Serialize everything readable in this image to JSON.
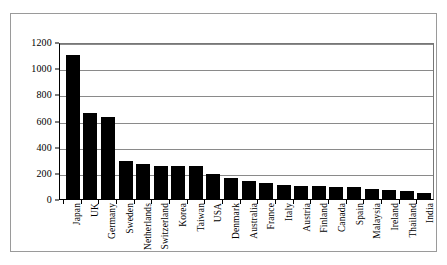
{
  "chart_data": {
    "type": "bar",
    "title": "",
    "subtitle": "",
    "xlabel": "",
    "ylabel": "",
    "ylim": [
      0,
      1200
    ],
    "yticks": [
      0,
      200,
      400,
      600,
      800,
      1000,
      1200
    ],
    "ytick_labels": [
      "0",
      "200",
      "400",
      "600",
      "800",
      "1000",
      "1200"
    ],
    "grid": true,
    "legend": false,
    "legend_position": "none",
    "orientation": "vertical",
    "bar_color": "#000000",
    "categories": [
      "Japan",
      "UK",
      "Germany",
      "Sweden",
      "Netherlands",
      "Switzerland",
      "Korea",
      "Taiwan",
      "USA",
      "Denmark",
      "Australia",
      "France",
      "Italy",
      "Austria",
      "Finland",
      "Canada",
      "Spain",
      "Malaysia",
      "Ireland",
      "Thailand",
      "India"
    ],
    "values": [
      1100,
      655,
      630,
      290,
      265,
      255,
      255,
      250,
      195,
      160,
      135,
      125,
      110,
      100,
      100,
      95,
      90,
      75,
      70,
      60,
      45
    ]
  }
}
